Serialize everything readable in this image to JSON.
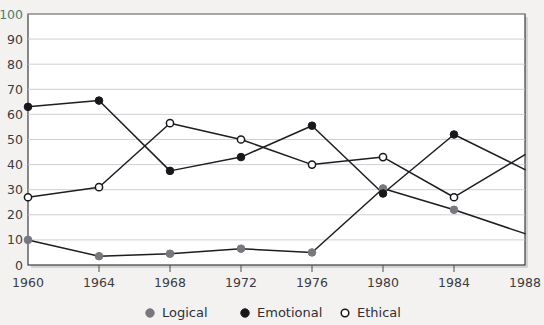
{
  "chart_data": {
    "type": "line",
    "title": "",
    "xlabel": "",
    "ylabel": "",
    "x": [
      1960,
      1964,
      1968,
      1972,
      1976,
      1980,
      1984,
      1988
    ],
    "categories": [
      "1960",
      "1964",
      "1968",
      "1972",
      "1976",
      "1980",
      "1984",
      "1988"
    ],
    "xlim": [
      1960,
      1988
    ],
    "ylim": [
      0,
      100
    ],
    "yticks": [
      0,
      10,
      20,
      30,
      40,
      50,
      60,
      70,
      80,
      90,
      100
    ],
    "ytick_labels": [
      "0",
      "10",
      "20",
      "30",
      "40",
      "50",
      "60",
      "70",
      "80",
      "90",
      "100"
    ],
    "grid": true,
    "legend_position": "bottom",
    "series": [
      {
        "name": "Logical",
        "marker": "filled-circle",
        "color": "#77777e",
        "values": [
          10,
          3.5,
          4.5,
          6.5,
          5,
          30.5,
          22,
          12.5
        ]
      },
      {
        "name": "Emotional",
        "marker": "filled-circle",
        "color": "#17171c",
        "values": [
          63,
          65.5,
          37.5,
          43,
          55.5,
          28.5,
          52,
          38
        ]
      },
      {
        "name": "Ethical",
        "marker": "open-circle",
        "color": "#ffffff",
        "values": [
          27,
          31,
          56.5,
          50,
          40,
          43,
          27,
          44
        ]
      }
    ]
  },
  "legend": {
    "items": [
      {
        "label": "Logical",
        "marker": "filled-circle-gray"
      },
      {
        "label": "Emotional",
        "marker": "filled-circle-black"
      },
      {
        "label": "Ethical",
        "marker": "open-circle"
      }
    ]
  },
  "axes": {
    "y_axis_name": "percentage-axis",
    "x_axis_name": "year-axis"
  }
}
